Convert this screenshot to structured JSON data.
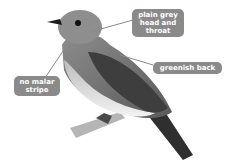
{
  "image": {
    "subject": "bird illustration",
    "colors": {
      "callout_bg": "#8a8a8a",
      "callout_text": "#ffffff",
      "leader_line": "#8a8a8a",
      "background": "#ffffff"
    }
  },
  "callouts": [
    {
      "id": "head",
      "text": "plain grey\nhead and\nthroat"
    },
    {
      "id": "back",
      "text": "greenish back"
    },
    {
      "id": "malar",
      "text": "no malar\nstripe"
    }
  ]
}
